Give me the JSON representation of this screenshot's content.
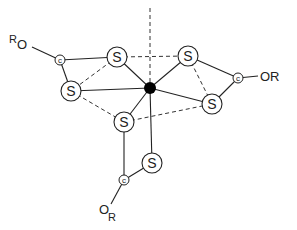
{
  "diagram": {
    "center": {
      "label": "",
      "x": 150,
      "y": 88,
      "color": "#000000"
    },
    "sulfur_label": "S",
    "carbon_label": "c",
    "atoms": {
      "S1": {
        "x": 117,
        "y": 57
      },
      "S2": {
        "x": 188,
        "y": 56
      },
      "S3": {
        "x": 71,
        "y": 91
      },
      "S4": {
        "x": 212,
        "y": 104
      },
      "S5": {
        "x": 124,
        "y": 122
      },
      "S6": {
        "x": 152,
        "y": 163
      },
      "C1": {
        "x": 60,
        "y": 60
      },
      "C2": {
        "x": 238,
        "y": 78
      },
      "C3": {
        "x": 124,
        "y": 180
      }
    },
    "groups": [
      {
        "id": "g1",
        "main": "R",
        "sub": "O",
        "text": "RO",
        "attached_to": "C1"
      },
      {
        "id": "g2",
        "main": "OR",
        "sub": "",
        "text": "OR",
        "attached_to": "C2"
      },
      {
        "id": "g3",
        "main": "O",
        "sub": "R",
        "text": "OR",
        "attached_to": "C3"
      }
    ],
    "solid_bonds": [
      [
        "M",
        "S1"
      ],
      [
        "M",
        "S2"
      ],
      [
        "M",
        "S3"
      ],
      [
        "M",
        "S4"
      ],
      [
        "M",
        "S5"
      ],
      [
        "M",
        "S6"
      ],
      [
        "C1",
        "S1"
      ],
      [
        "C1",
        "S3"
      ],
      [
        "C2",
        "S2"
      ],
      [
        "C2",
        "S4"
      ],
      [
        "C3",
        "S5"
      ],
      [
        "C3",
        "S6"
      ]
    ],
    "dashed_edges": [
      [
        "S1",
        "S2"
      ],
      [
        "S1",
        "S3"
      ],
      [
        "S2",
        "S4"
      ],
      [
        "S3",
        "S5"
      ],
      [
        "S5",
        "S4"
      ],
      [
        "axis_top",
        "M"
      ]
    ]
  }
}
